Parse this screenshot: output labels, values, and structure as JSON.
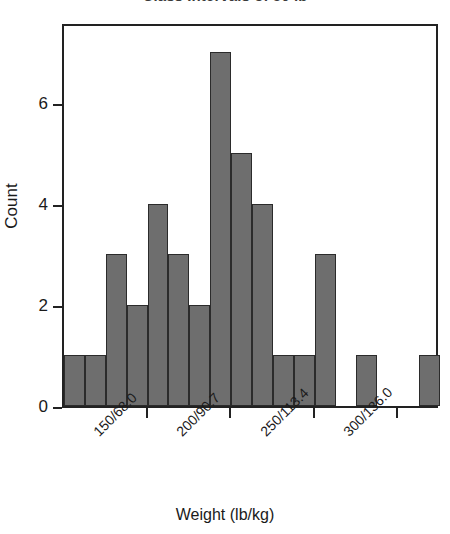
{
  "chart_data": {
    "type": "bar",
    "title": "Class Intervals of 50 lb",
    "xlabel": "Weight (lb/kg)",
    "ylabel": "Count",
    "grid": false,
    "legend": null,
    "xlim": [
      100,
      325
    ],
    "ylim": [
      0,
      7.6
    ],
    "bin_width": 12.5,
    "x_tick_labels": [
      "150/68.0",
      "200/90.7",
      "250/113.4",
      "300/136.0"
    ],
    "x_tick_values": [
      150,
      200,
      250,
      300
    ],
    "y_tick_labels": [
      "0",
      "2",
      "4",
      "6"
    ],
    "y_tick_values": [
      0,
      2,
      4,
      6
    ],
    "categories": [
      "100",
      "112.5",
      "125",
      "137.5",
      "150",
      "162.5",
      "175",
      "187.5",
      "200",
      "212.5",
      "225",
      "237.5",
      "250",
      "262.5",
      "275",
      "287.5",
      "300",
      "312.5"
    ],
    "values": [
      1,
      1,
      3,
      2,
      4,
      3,
      2,
      7,
      5,
      4,
      1,
      1,
      3,
      0,
      1,
      0,
      0,
      1
    ],
    "bars": [
      {
        "bin_start": 100.0,
        "bin_end": 112.5,
        "count": 1
      },
      {
        "bin_start": 112.5,
        "bin_end": 125.0,
        "count": 1
      },
      {
        "bin_start": 125.0,
        "bin_end": 137.5,
        "count": 3
      },
      {
        "bin_start": 137.5,
        "bin_end": 150.0,
        "count": 2
      },
      {
        "bin_start": 150.0,
        "bin_end": 162.5,
        "count": 4
      },
      {
        "bin_start": 162.5,
        "bin_end": 175.0,
        "count": 3
      },
      {
        "bin_start": 175.0,
        "bin_end": 187.5,
        "count": 2
      },
      {
        "bin_start": 187.5,
        "bin_end": 200.0,
        "count": 7
      },
      {
        "bin_start": 200.0,
        "bin_end": 212.5,
        "count": 5
      },
      {
        "bin_start": 212.5,
        "bin_end": 225.0,
        "count": 4
      },
      {
        "bin_start": 225.0,
        "bin_end": 237.5,
        "count": 1
      },
      {
        "bin_start": 237.5,
        "bin_end": 250.0,
        "count": 1
      },
      {
        "bin_start": 250.0,
        "bin_end": 262.5,
        "count": 3
      },
      {
        "bin_start": 262.5,
        "bin_end": 275.0,
        "count": 0
      },
      {
        "bin_start": 275.0,
        "bin_end": 287.5,
        "count": 1
      },
      {
        "bin_start": 287.5,
        "bin_end": 300.0,
        "count": 0
      },
      {
        "bin_start": 300.0,
        "bin_end": 312.5,
        "count": 0
      },
      {
        "bin_start": 312.5,
        "bin_end": 325.0,
        "count": 1
      }
    ],
    "colors": {
      "bar_fill": "#6e6e6e",
      "bar_edge": "#2b2b2b",
      "axis": "#222222",
      "text": "#1a1a1a",
      "background": "#ffffff"
    }
  }
}
